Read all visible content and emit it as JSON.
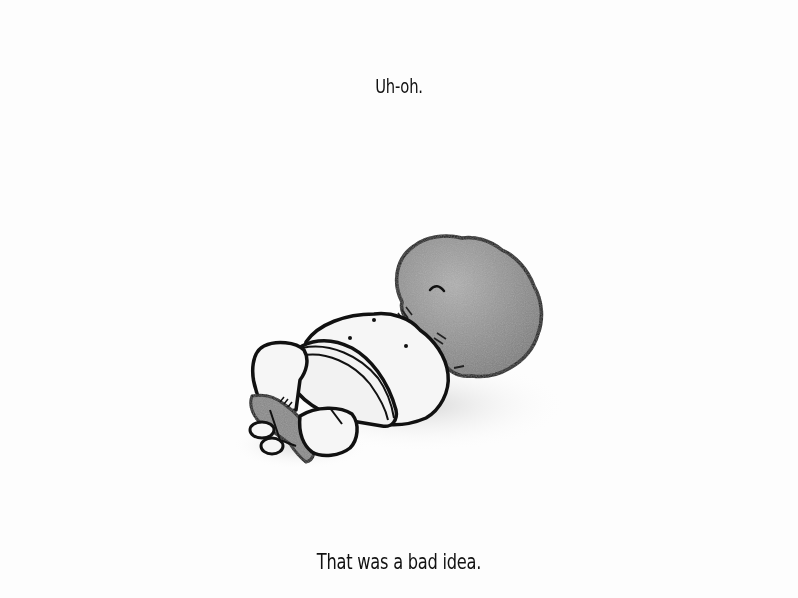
{
  "page": {
    "top_caption": "Uh-oh.",
    "bottom_caption": "That was a bad idea."
  },
  "illustration": {
    "description": "Character lying on its back with its head stuck inside a large gray lumpy rock, a small gray leaf-like creature at its feet",
    "colors": {
      "background": "#fdfdfd",
      "outline": "#111111",
      "body_fill": "#f4f4f4",
      "rock_fill": "#9a9a9a",
      "leaf_fill": "#8a8a8a",
      "shadow": "#d8d8d8"
    }
  }
}
